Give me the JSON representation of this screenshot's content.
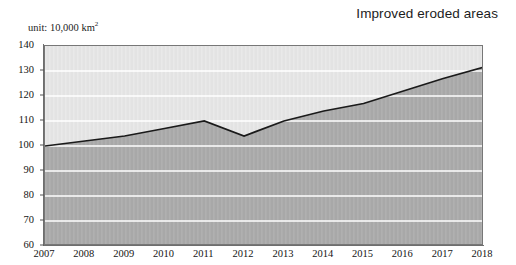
{
  "header": {
    "title": "Improved eroded areas",
    "unit_prefix": "unit: 10,000 km",
    "unit_exponent": "2"
  },
  "chart_data": {
    "type": "area",
    "title": "Improved eroded areas",
    "xlabel": "",
    "ylabel": "",
    "unit": "10,000 km2",
    "categories": [
      "2007",
      "2008",
      "2009",
      "2010",
      "2011",
      "2012",
      "2013",
      "2014",
      "2015",
      "2016",
      "2017",
      "2018"
    ],
    "values": [
      100,
      102,
      104,
      107,
      110,
      104,
      110,
      114,
      117,
      122,
      127,
      131.5
    ],
    "series": [
      {
        "name": "Improved eroded areas",
        "values": [
          100,
          102,
          104,
          107,
          110,
          104,
          110,
          114,
          117,
          122,
          127,
          131.5
        ]
      }
    ],
    "ylim": [
      60,
      140
    ],
    "ytick_labels": [
      "140",
      "130",
      "120",
      "110",
      "100",
      "90",
      "80",
      "70",
      "60"
    ],
    "ytick_values": [
      140,
      130,
      120,
      110,
      100,
      90,
      80,
      70,
      60
    ],
    "xtick_labels": [
      "2007",
      "2008",
      "2009",
      "2010",
      "2011",
      "2012",
      "2013",
      "2014",
      "2015",
      "2016",
      "2017",
      "2018"
    ],
    "grid": true,
    "grid_color": "#ffffff",
    "legend": "none",
    "colors": {
      "plot_background": "#e3e3e3",
      "area_fill": "#a8a8a8",
      "line": "#1a1a1a",
      "axis": "#6e6e6e",
      "text": "#141414"
    }
  }
}
